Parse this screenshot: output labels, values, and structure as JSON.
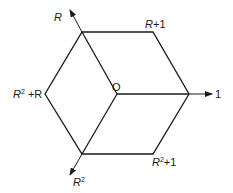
{
  "diagram": {
    "type": "hexagon-lattice-cube-projection",
    "origin": {
      "label": "O",
      "x": 117,
      "y": 94
    },
    "vertices": [
      {
        "id": "R",
        "x": 82,
        "y": 32
      },
      {
        "id": "R+1",
        "x": 153,
        "y": 32
      },
      {
        "id": "1",
        "x": 189,
        "y": 94
      },
      {
        "id": "R2+1",
        "x": 153,
        "y": 154
      },
      {
        "id": "R2",
        "x": 82,
        "y": 154
      },
      {
        "id": "R2+R",
        "x": 45,
        "y": 94
      }
    ],
    "axes": [
      {
        "id": "R",
        "from": [
          117,
          94
        ],
        "to": [
          70,
          10
        ],
        "label": "R"
      },
      {
        "id": "1",
        "from": [
          117,
          94
        ],
        "to": [
          212,
          94
        ],
        "label": "1"
      },
      {
        "id": "R2",
        "from": [
          117,
          94
        ],
        "to": [
          70,
          175
        ],
        "label": "R²"
      }
    ],
    "labels": {
      "origin": "O",
      "r_axis": "R",
      "one_axis": "1",
      "r2_axis_base": "R",
      "r2_axis_exp": "2",
      "r_plus_1_base": "R",
      "r_plus_1_rest": "+1",
      "r2_plus_r_base": "R",
      "r2_plus_r_exp": "2",
      "r2_plus_r_rest": " +R",
      "r2_plus_1_base": "R",
      "r2_plus_1_exp": "2",
      "r2_plus_1_rest": "+1"
    },
    "colors": {
      "stroke": "#1a1a1a",
      "background": "#ffffff"
    }
  }
}
